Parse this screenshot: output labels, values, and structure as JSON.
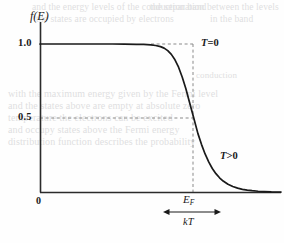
{
  "figure": {
    "kind": "physics-plot",
    "background_color": "#fefefe",
    "ink_color": "#1a1a1a",
    "dash_color": "#8a8a8a",
    "ghost_color": "#dfdfe1"
  },
  "axes": {
    "y_label": "f(E)",
    "y_ticks": [
      {
        "label": "1.0",
        "value": 1.0
      },
      {
        "label": "0.5",
        "value": 0.5
      }
    ],
    "origin_label": "0",
    "x_label": "",
    "x_axis_pixel_y": 192,
    "y_axis_pixel_x": 40,
    "y_value_one_pixel_y": 44,
    "y_value_half_pixel_y": 118
  },
  "annotations": {
    "t_zero": {
      "symbol": "T",
      "relation": "=",
      "value": "0"
    },
    "t_positive": {
      "symbol": "T",
      "relation": ">",
      "value": "0"
    },
    "fermi_energy": {
      "symbol": "E",
      "subscript": "F"
    },
    "thermal_width": {
      "symbol": "kT"
    }
  },
  "chart_data": {
    "type": "line",
    "title": "",
    "xlabel": "",
    "ylabel": "f(E)",
    "xlim": [
      0,
      1
    ],
    "ylim": [
      0,
      1.12
    ],
    "grid": false,
    "legend": "inline-annotations",
    "ytick_values": [
      0.5,
      1.0
    ],
    "ytick_labels": [
      "0.5",
      "1.0"
    ],
    "xtick_values": [
      0.0
    ],
    "xtick_labels": [
      "0"
    ],
    "markers": {
      "fermi_energy_x": 0.638,
      "fermi_energy_f": 0.5,
      "kT_span_x": [
        0.513,
        0.755
      ]
    },
    "guide_lines": [
      {
        "name": "f=1.0 dashed to T=0 step",
        "orientation": "horizontal",
        "y": 1.0,
        "x_from": 0.532,
        "x_to": 0.638,
        "style": "dashed"
      },
      {
        "name": "f=0.5 dashed to curve",
        "orientation": "horizontal",
        "y": 0.5,
        "x_from": 0.0,
        "x_to": 0.638,
        "style": "dashed"
      },
      {
        "name": "E=E_F vertical (T=0 step)",
        "orientation": "vertical",
        "x": 0.638,
        "y_from": 0.0,
        "y_to": 1.0,
        "style": "dashed"
      }
    ],
    "series": [
      {
        "name": "T>0",
        "style": "solid",
        "x": [
          0.0,
          0.05,
          0.1,
          0.15,
          0.2,
          0.25,
          0.3,
          0.35,
          0.4,
          0.43,
          0.46,
          0.48,
          0.5,
          0.515,
          0.53,
          0.545,
          0.56,
          0.575,
          0.59,
          0.605,
          0.62,
          0.638,
          0.655,
          0.67,
          0.685,
          0.7,
          0.715,
          0.73,
          0.745,
          0.76,
          0.78,
          0.8,
          0.82,
          0.84,
          0.86,
          0.88,
          0.905,
          0.93,
          0.96,
          1.0
        ],
        "values": [
          1.0,
          1.0,
          1.0,
          1.0,
          1.0,
          1.0,
          1.0,
          0.999,
          0.998,
          0.997,
          0.994,
          0.99,
          0.982,
          0.972,
          0.955,
          0.93,
          0.893,
          0.843,
          0.777,
          0.699,
          0.608,
          0.5,
          0.396,
          0.322,
          0.257,
          0.203,
          0.159,
          0.124,
          0.096,
          0.074,
          0.052,
          0.037,
          0.026,
          0.018,
          0.013,
          0.009,
          0.005,
          0.003,
          0.001,
          0.0
        ]
      },
      {
        "name": "T=0",
        "style": "dashed-step",
        "x": [
          0.532,
          0.638,
          0.638
        ],
        "values": [
          1.0,
          1.0,
          0.0
        ]
      }
    ]
  },
  "ghost_text": {
    "note": "faint bleed-through text from the reverse side of the scanned page",
    "lines": [
      {
        "text": "and the energy levels of the conduction band",
        "left": 32,
        "top": 2,
        "size": 9.5
      },
      {
        "text": "the separation between the levels",
        "left": 150,
        "top": 2,
        "size": 9.5
      },
      {
        "text": "the states are occupied by electrons",
        "left": 36,
        "top": 14,
        "size": 9.5
      },
      {
        "text": "in the band",
        "left": 210,
        "top": 14,
        "size": 9.5
      },
      {
        "text": "conduction",
        "left": 196,
        "top": 70,
        "size": 9
      },
      {
        "text": "with the maximum energy given by the Fermi level",
        "left": 8,
        "top": 88,
        "size": 10
      },
      {
        "text": "and the states above are empty at absolute zero",
        "left": 8,
        "top": 100,
        "size": 10
      },
      {
        "text": "temperature the electrons can be excited",
        "left": 8,
        "top": 112,
        "size": 10
      },
      {
        "text": "and occupy states above the Fermi energy",
        "left": 8,
        "top": 124,
        "size": 10
      },
      {
        "text": "distribution function describes the probability",
        "left": 8,
        "top": 136,
        "size": 10
      }
    ]
  }
}
